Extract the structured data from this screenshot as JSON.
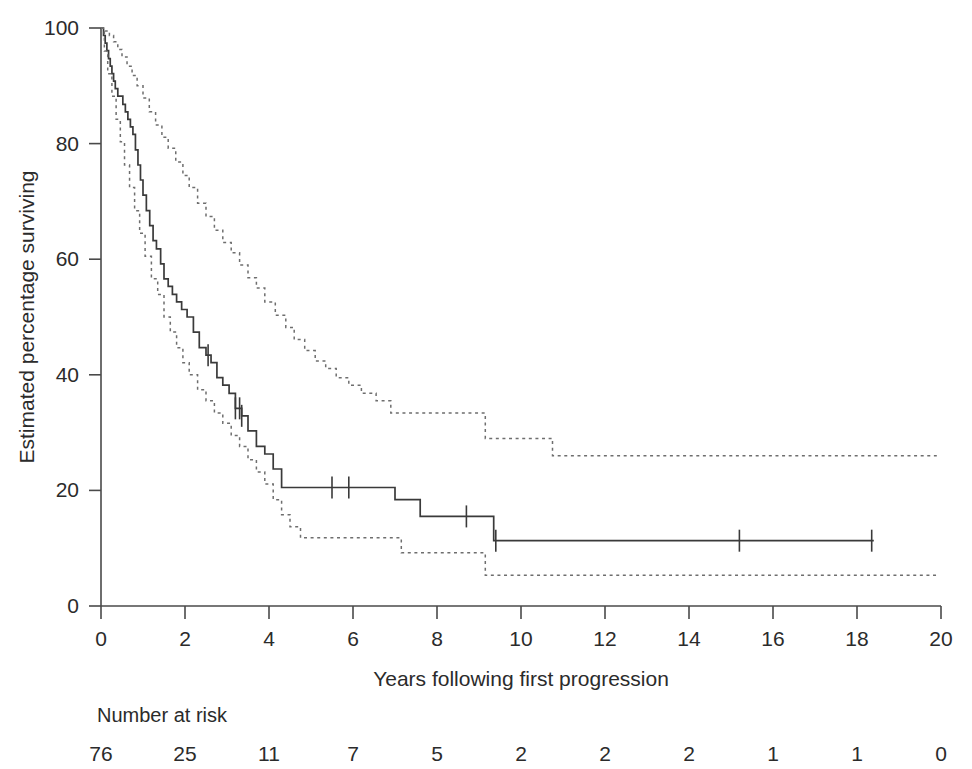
{
  "chart_data": {
    "type": "line",
    "title": "",
    "xlabel": "Years following first progression",
    "ylabel": "Estimated percentage surviving",
    "xlim": [
      0,
      20
    ],
    "ylim": [
      0,
      100
    ],
    "xticks": [
      0,
      2,
      4,
      6,
      8,
      10,
      12,
      14,
      16,
      18,
      20
    ],
    "xtick_labels": [
      "0",
      "2",
      "4",
      "6",
      "8",
      "10",
      "12",
      "14",
      "16",
      "18",
      "20"
    ],
    "yticks": [
      0,
      20,
      40,
      60,
      80,
      100
    ],
    "ytick_labels": [
      "0",
      "20",
      "40",
      "60",
      "80",
      "100"
    ],
    "grid": false,
    "legend": "none",
    "series": [
      {
        "name": "Kaplan-Meier estimate",
        "style": "solid",
        "points": [
          [
            0.0,
            100.0
          ],
          [
            0.06,
            98.7
          ],
          [
            0.1,
            97.4
          ],
          [
            0.14,
            96.1
          ],
          [
            0.18,
            94.7
          ],
          [
            0.22,
            93.4
          ],
          [
            0.26,
            92.1
          ],
          [
            0.3,
            90.8
          ],
          [
            0.34,
            89.5
          ],
          [
            0.4,
            88.2
          ],
          [
            0.52,
            86.8
          ],
          [
            0.58,
            85.5
          ],
          [
            0.64,
            84.2
          ],
          [
            0.7,
            82.9
          ],
          [
            0.76,
            81.6
          ],
          [
            0.82,
            78.9
          ],
          [
            0.88,
            76.3
          ],
          [
            0.94,
            73.7
          ],
          [
            1.0,
            71.1
          ],
          [
            1.08,
            68.4
          ],
          [
            1.16,
            65.8
          ],
          [
            1.24,
            63.2
          ],
          [
            1.32,
            61.8
          ],
          [
            1.42,
            59.2
          ],
          [
            1.5,
            56.6
          ],
          [
            1.6,
            55.3
          ],
          [
            1.7,
            53.9
          ],
          [
            1.8,
            52.6
          ],
          [
            1.92,
            51.3
          ],
          [
            2.05,
            50.0
          ],
          [
            2.2,
            47.4
          ],
          [
            2.34,
            44.7
          ],
          [
            2.5,
            43.4
          ],
          [
            2.62,
            42.1
          ],
          [
            2.76,
            39.5
          ],
          [
            2.9,
            38.2
          ],
          [
            3.05,
            36.8
          ],
          [
            3.2,
            34.2
          ],
          [
            3.35,
            32.9
          ],
          [
            3.5,
            30.3
          ],
          [
            3.7,
            27.6
          ],
          [
            3.9,
            26.3
          ],
          [
            4.1,
            23.7
          ],
          [
            4.3,
            20.5
          ],
          [
            6.85,
            20.5
          ],
          [
            7.0,
            18.4
          ],
          [
            7.45,
            18.4
          ],
          [
            7.6,
            15.5
          ],
          [
            9.2,
            15.5
          ],
          [
            9.35,
            11.3
          ],
          [
            18.4,
            11.3
          ]
        ],
        "censor_times": [
          2.55,
          3.2,
          3.3,
          3.35,
          5.5,
          5.9,
          8.7,
          9.4,
          15.2,
          18.35
        ]
      },
      {
        "name": "Upper 95% confidence limit",
        "style": "dashed",
        "points": [
          [
            0.0,
            100.0
          ],
          [
            0.1,
            99.5
          ],
          [
            0.2,
            98.7
          ],
          [
            0.3,
            97.6
          ],
          [
            0.4,
            96.3
          ],
          [
            0.5,
            95.0
          ],
          [
            0.62,
            93.4
          ],
          [
            0.74,
            91.8
          ],
          [
            0.86,
            90.0
          ],
          [
            1.0,
            87.9
          ],
          [
            1.15,
            85.5
          ],
          [
            1.3,
            83.2
          ],
          [
            1.45,
            81.1
          ],
          [
            1.6,
            79.2
          ],
          [
            1.78,
            76.8
          ],
          [
            1.95,
            74.5
          ],
          [
            2.1,
            72.4
          ],
          [
            2.3,
            69.7
          ],
          [
            2.5,
            67.4
          ],
          [
            2.7,
            65.0
          ],
          [
            2.9,
            62.9
          ],
          [
            3.1,
            61.1
          ],
          [
            3.3,
            59.0
          ],
          [
            3.5,
            56.8
          ],
          [
            3.7,
            55.0
          ],
          [
            3.9,
            52.6
          ],
          [
            4.15,
            50.3
          ],
          [
            4.4,
            48.2
          ],
          [
            4.6,
            46.1
          ],
          [
            4.85,
            44.2
          ],
          [
            5.1,
            42.4
          ],
          [
            5.35,
            41.1
          ],
          [
            5.6,
            39.5
          ],
          [
            5.9,
            38.2
          ],
          [
            6.2,
            36.8
          ],
          [
            6.55,
            35.5
          ],
          [
            6.9,
            33.4
          ],
          [
            9.0,
            33.4
          ],
          [
            9.15,
            29.0
          ],
          [
            10.6,
            29.0
          ],
          [
            10.75,
            26.0
          ],
          [
            19.9,
            26.0
          ]
        ],
        "censor_times": []
      },
      {
        "name": "Lower 95% confidence limit",
        "style": "dashed",
        "points": [
          [
            0.0,
            100.0
          ],
          [
            0.08,
            96.0
          ],
          [
            0.16,
            92.1
          ],
          [
            0.26,
            88.2
          ],
          [
            0.36,
            84.2
          ],
          [
            0.46,
            80.3
          ],
          [
            0.56,
            76.3
          ],
          [
            0.68,
            72.4
          ],
          [
            0.8,
            68.4
          ],
          [
            0.92,
            64.5
          ],
          [
            1.05,
            60.5
          ],
          [
            1.2,
            56.6
          ],
          [
            1.35,
            53.9
          ],
          [
            1.5,
            50.0
          ],
          [
            1.65,
            47.4
          ],
          [
            1.8,
            44.7
          ],
          [
            1.95,
            42.1
          ],
          [
            2.1,
            40.0
          ],
          [
            2.3,
            37.4
          ],
          [
            2.5,
            35.5
          ],
          [
            2.7,
            33.4
          ],
          [
            2.9,
            31.6
          ],
          [
            3.1,
            29.5
          ],
          [
            3.3,
            27.6
          ],
          [
            3.5,
            25.3
          ],
          [
            3.7,
            23.2
          ],
          [
            3.9,
            21.1
          ],
          [
            4.1,
            18.4
          ],
          [
            4.3,
            15.8
          ],
          [
            4.5,
            13.7
          ],
          [
            4.75,
            11.8
          ],
          [
            7.0,
            11.8
          ],
          [
            7.15,
            9.2
          ],
          [
            9.0,
            9.2
          ],
          [
            9.15,
            5.3
          ],
          [
            19.9,
            5.3
          ]
        ],
        "censor_times": []
      }
    ],
    "number_at_risk": {
      "label": "Number at risk",
      "times": [
        0,
        2,
        4,
        6,
        8,
        10,
        12,
        14,
        16,
        18,
        20
      ],
      "values": [
        "76",
        "25",
        "11",
        "7",
        "5",
        "2",
        "2",
        "2",
        "1",
        "1",
        "0"
      ]
    }
  },
  "colors": {
    "curve": "#3a3a3a",
    "confidence": "#6e6e6e",
    "axis": "#4a4a4a",
    "text": "#2b2b2b",
    "background": "#ffffff"
  }
}
